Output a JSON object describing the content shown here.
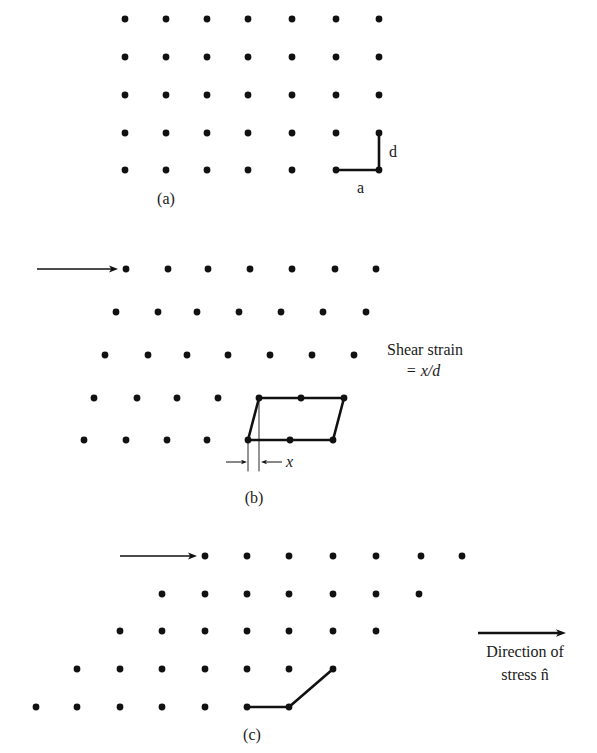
{
  "figure": {
    "ink_color": "#111111",
    "dot_radius": 3.4,
    "panels": [
      {
        "id": "a",
        "caption": "(a)",
        "caption_pos": [
          166,
          204
        ],
        "rows": [
          {
            "y": 19,
            "xs": [
              125,
              166,
              207,
              248,
              292,
              336,
              379
            ]
          },
          {
            "y": 57,
            "xs": [
              125,
              166,
              207,
              248,
              292,
              336,
              379
            ]
          },
          {
            "y": 95,
            "xs": [
              125,
              166,
              207,
              248,
              292,
              336,
              379
            ]
          },
          {
            "y": 133,
            "xs": [
              125,
              166,
              207,
              248,
              292,
              336,
              379
            ]
          },
          {
            "y": 170,
            "xs": [
              125,
              166,
              207,
              248,
              292,
              336,
              379
            ]
          }
        ],
        "lines": [
          {
            "points": [
              [
                336,
                170
              ],
              [
                379,
                170
              ]
            ],
            "width": 2.6
          },
          {
            "points": [
              [
                379,
                133
              ],
              [
                379,
                170
              ]
            ],
            "width": 2.6
          }
        ],
        "labels": [
          {
            "text": "a",
            "x": 357,
            "y": 193,
            "italic": false,
            "size": 16
          },
          {
            "text": "d",
            "x": 389,
            "y": 157,
            "italic": false,
            "size": 16
          }
        ],
        "arrows": []
      },
      {
        "id": "b",
        "caption": "(b)",
        "caption_pos": [
          254,
          503
        ],
        "rows": [
          {
            "y": 269,
            "xs": [
              126,
              168,
              208,
              250,
              292,
              335,
              376
            ]
          },
          {
            "y": 312,
            "xs": [
              116,
              158,
              197,
              239,
              281,
              323,
              366
            ]
          },
          {
            "y": 355,
            "xs": [
              105,
              148,
              187,
              228,
              270,
              312,
              354
            ]
          },
          {
            "y": 398,
            "xs": [
              94,
              137,
              177,
              218,
              259,
              301,
              344
            ]
          },
          {
            "y": 440,
            "xs": [
              84,
              126,
              167,
              207,
              248,
              290,
              333
            ]
          }
        ],
        "lines": [
          {
            "points": [
              [
                259,
                398
              ],
              [
                344,
                398
              ],
              [
                333,
                440
              ],
              [
                248,
                440
              ],
              [
                259,
                398
              ]
            ],
            "width": 2.6
          },
          {
            "points": [
              [
                248,
                443
              ],
              [
                248,
                471
              ]
            ],
            "width": 0.9
          },
          {
            "points": [
              [
                259,
                401
              ],
              [
                259,
                471
              ]
            ],
            "width": 0.9
          }
        ],
        "arrows": [
          {
            "from": [
              37,
              269
            ],
            "to": [
              118,
              269
            ],
            "width": 1.6,
            "head": 9
          },
          {
            "from": [
              226,
              462
            ],
            "to": [
              247,
              462
            ],
            "width": 1.0,
            "head": 6
          },
          {
            "from": [
              282,
              462
            ],
            "to": [
              261,
              462
            ],
            "width": 1.0,
            "head": 6
          }
        ],
        "labels": [
          {
            "text": "x",
            "x": 286,
            "y": 467,
            "italic": true,
            "size": 16
          },
          {
            "text": "Shear strain",
            "x": 425,
            "y": 355,
            "italic": false,
            "size": 16,
            "anchor": "middle"
          },
          {
            "text": "= x/d",
            "x": 423,
            "y": 376,
            "italic": true,
            "size": 16,
            "anchor": "middle"
          }
        ]
      },
      {
        "id": "c",
        "caption": "(c)",
        "caption_pos": [
          252,
          740
        ],
        "rows": [
          {
            "y": 556,
            "xs": [
              205,
              247,
              289,
              333,
              376,
              421,
              462
            ]
          },
          {
            "y": 594,
            "xs": [
              162,
              205,
              247,
              289,
              333,
              376,
              419
            ]
          },
          {
            "y": 631,
            "xs": [
              120,
              162,
              205,
              247,
              289,
              333,
              376
            ]
          },
          {
            "y": 669,
            "xs": [
              77,
              120,
              162,
              205,
              247,
              289,
              333
            ]
          },
          {
            "y": 707,
            "xs": [
              36,
              77,
              120,
              162,
              205,
              247,
              289
            ]
          }
        ],
        "lines": [
          {
            "points": [
              [
                247,
                707
              ],
              [
                289,
                707
              ],
              [
                333,
                669
              ]
            ],
            "width": 2.6
          }
        ],
        "arrows": [
          {
            "from": [
              120,
              556
            ],
            "to": [
              197,
              556
            ],
            "width": 1.6,
            "head": 9
          },
          {
            "from": [
              478,
              633
            ],
            "to": [
              566,
              633
            ],
            "width": 2.4,
            "head": 10
          }
        ],
        "labels": [
          {
            "text": "Direction of",
            "x": 525,
            "y": 657,
            "italic": false,
            "size": 16,
            "anchor": "middle"
          },
          {
            "text": "stress n̂",
            "x": 525,
            "y": 680,
            "italic": false,
            "size": 16,
            "anchor": "middle"
          }
        ]
      }
    ]
  }
}
